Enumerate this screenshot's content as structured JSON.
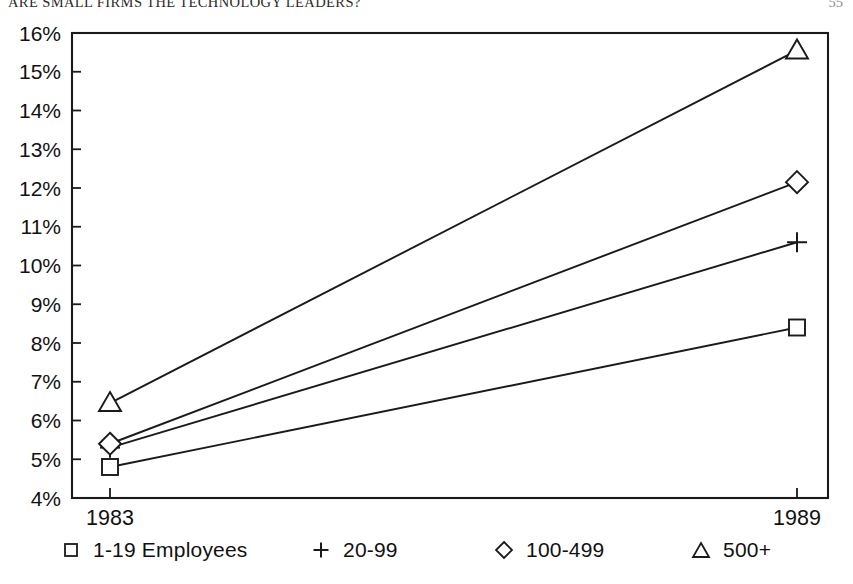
{
  "header": {
    "title": "ARE SMALL FIRMS THE TECHNOLOGY LEADERS?",
    "folio": "55"
  },
  "chart_data": {
    "type": "line",
    "title": "",
    "xlabel": "",
    "ylabel": "",
    "x": [
      "1983",
      "1989"
    ],
    "xtick_labels": [
      "1983",
      "1989"
    ],
    "ytick_labels": [
      "16%",
      "15%",
      "14%",
      "13%",
      "12%",
      "11%",
      "10%",
      "9%",
      "8%",
      "7%",
      "6%",
      "5%",
      "4%"
    ],
    "yticks": [
      16,
      15,
      14,
      13,
      12,
      11,
      10,
      9,
      8,
      7,
      6,
      5,
      4
    ],
    "ylim": [
      4,
      16
    ],
    "grid": false,
    "legend_position": "bottom",
    "value_suffix": "%",
    "series": [
      {
        "name": "1-19 Employees",
        "marker": "square",
        "values": [
          4.8,
          8.4
        ]
      },
      {
        "name": "20-99",
        "marker": "plus",
        "values": [
          5.3,
          10.6
        ]
      },
      {
        "name": "100-499",
        "marker": "diamond",
        "values": [
          5.4,
          12.15
        ]
      },
      {
        "name": "500+",
        "marker": "triangle",
        "values": [
          6.45,
          15.55
        ]
      }
    ]
  },
  "legend": {
    "items": [
      {
        "glyph": "square-marker-icon",
        "label": "1-19 Employees"
      },
      {
        "glyph": "plus-marker-icon",
        "label": "20-99"
      },
      {
        "glyph": "diamond-marker-icon",
        "label": "100-499"
      },
      {
        "glyph": "triangle-marker-icon",
        "label": "500+"
      }
    ]
  },
  "colors": {
    "ink": "#1a1a1a",
    "background": "#ffffff"
  }
}
